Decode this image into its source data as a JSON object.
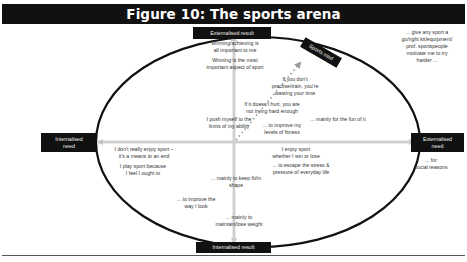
{
  "figure": {
    "title": "Figure 10: The sports arena"
  },
  "axes": {
    "top": "Externalised result",
    "bottom": "Internalised result",
    "left": "Internalised\nneed",
    "right": "Externalised\nneed",
    "corner_label": "Sports mad"
  },
  "notes": {
    "winning_all_important": "Winning/achieving is\nall important to me",
    "winning_most_important": "Winning is the most\nimportant aspect of sport",
    "practise_tough": "If you don't\npractise/train, you're\nwasting your time",
    "doesnt_hurt": "If it doesn't hurt, you are\nnot trying hard enough",
    "push_limits": "I push myself to the\nlimits of my ability",
    "improve_fitness": "... to improve my\nlevels of fitness",
    "fun": "... mainly for the fun of it",
    "give_any_sport": "... give any sport a\ngo/right kit/equipment/\nprof. sportspeople\nmotivate me to try\nharder ...",
    "social_reasons": "... for\nsocial reasons",
    "dont_enjoy": "I don't really enjoy sport –\nit's a means to an end",
    "ought_to": "I play sport because\nI feel I ought to",
    "enjoy_win_lose": "I enjoy sport\nwhether I win or lose",
    "escape_stress": "... to escape the stress &\npressure of everyday life",
    "keep_fit": "... mainly to keep fit/in\nshape",
    "improve_look": "... to improve the\nway I look",
    "lose_weight": "... mainly to\nmaintain/lose weight"
  },
  "colors": {
    "box_bg": "#111111",
    "axis_arrow": "#c8c8c8",
    "ellipse": "#111111",
    "dotted_arrow": "#9a9a9a"
  }
}
